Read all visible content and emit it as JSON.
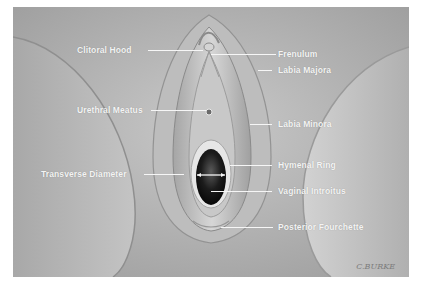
{
  "figure": {
    "labels": {
      "clitoral_hood": "Clitoral Hood",
      "frenulum": "Frenulum",
      "labia_majora": "Labia Majora",
      "urethral_meatus": "Urethral Meatus",
      "labia_minora": "Labia Minora",
      "hymenal_ring": "Hymenal Ring",
      "transverse_diameter": "Transverse Diameter",
      "vaginal_introitus": "Vaginal Introitus",
      "posterior_fourchette": "Posterior Fourchette"
    },
    "signature": "C.BURKE",
    "colors": {
      "background": "#ffffff",
      "illustration_base": "#b9b9b9",
      "label_text": "#f4f4f4",
      "introitus_dark": "#141414"
    }
  }
}
